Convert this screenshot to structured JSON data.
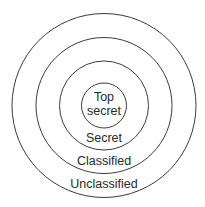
{
  "diagram": {
    "type": "concentric-circles",
    "stroke_color": "#3a3a3a",
    "text_color": "#2a2a2a",
    "rings": [
      {
        "level": "innermost",
        "label_lines": [
          "Top",
          "secret"
        ]
      },
      {
        "level": "second",
        "label": "Secret"
      },
      {
        "level": "third",
        "label": "Classified"
      },
      {
        "level": "outermost",
        "label": "Unclassified"
      }
    ]
  }
}
